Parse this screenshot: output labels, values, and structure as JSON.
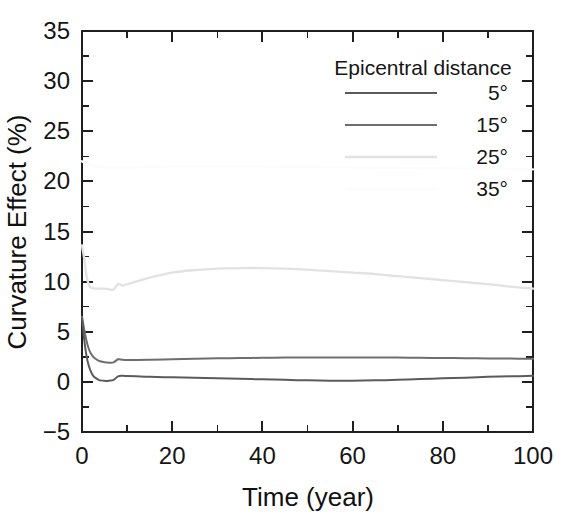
{
  "figure": {
    "background_color": "#ffffff",
    "axis_color": "#1f1f1f"
  },
  "axes": {
    "x_title": "Time (year)",
    "y_title": "Curvature Effect (%)",
    "x_ticks": [
      "0",
      "20",
      "40",
      "60",
      "80",
      "100"
    ],
    "y_ticks": [
      "-5",
      "0",
      "5",
      "10",
      "15",
      "20",
      "25",
      "30",
      "35"
    ]
  },
  "legend": {
    "title": "Epicentral distance",
    "entries": [
      {
        "label": "5°",
        "color": "#5b5b5b"
      },
      {
        "label": "15°",
        "color": "#6e6e6e"
      },
      {
        "label": "25°",
        "color": "#e2e2e2"
      },
      {
        "label": "35°",
        "color": "#fcfcfc"
      }
    ]
  },
  "chart_data": {
    "type": "line",
    "title": "",
    "xlabel": "Time (year)",
    "ylabel": "Curvature Effect (%)",
    "xlim": [
      0,
      100
    ],
    "ylim": [
      -5,
      35
    ],
    "xticks": [
      0,
      20,
      40,
      60,
      80,
      100
    ],
    "yticks": [
      -5,
      0,
      5,
      10,
      15,
      20,
      25,
      30,
      35
    ],
    "x_minor_step": 10,
    "y_minor_step": 2.5,
    "grid": false,
    "legend_position": "upper-right-inside",
    "legend_title": "Epicentral distance",
    "series": [
      {
        "name": "5°",
        "color": "#5b5b5b",
        "linewidth": 2.0,
        "x": [
          0.0,
          0.5,
          1.0,
          1.5,
          2.0,
          2.5,
          3.0,
          3.5,
          4.0,
          5.0,
          6.0,
          7.0,
          8.0,
          9.0,
          10.0,
          12.0,
          15.0,
          20.0,
          25.0,
          30.0,
          35.0,
          40.0,
          45.0,
          50.0,
          55.0,
          60.0,
          65.0,
          70.0,
          75.0,
          80.0,
          85.0,
          90.0,
          95.0,
          100.0
        ],
        "y": [
          6.4,
          4.2,
          2.6,
          1.6,
          1.0,
          0.6,
          0.4,
          0.25,
          0.15,
          0.1,
          0.12,
          0.2,
          0.55,
          0.6,
          0.58,
          0.55,
          0.5,
          0.45,
          0.4,
          0.35,
          0.3,
          0.25,
          0.2,
          0.15,
          0.12,
          0.12,
          0.15,
          0.2,
          0.28,
          0.35,
          0.42,
          0.5,
          0.55,
          0.6
        ]
      },
      {
        "name": "15°",
        "color": "#6e6e6e",
        "linewidth": 2.0,
        "x": [
          0.0,
          0.5,
          1.0,
          1.5,
          2.0,
          2.5,
          3.0,
          3.5,
          4.0,
          5.0,
          6.0,
          7.0,
          8.0,
          9.0,
          10.0,
          12.0,
          15.0,
          20.0,
          25.0,
          30.0,
          35.0,
          40.0,
          45.0,
          50.0,
          55.0,
          60.0,
          65.0,
          70.0,
          75.0,
          80.0,
          85.0,
          90.0,
          95.0,
          100.0
        ],
        "y": [
          6.5,
          5.2,
          4.1,
          3.3,
          2.8,
          2.5,
          2.3,
          2.15,
          2.05,
          1.95,
          1.92,
          1.95,
          2.25,
          2.2,
          2.18,
          2.18,
          2.2,
          2.25,
          2.3,
          2.35,
          2.38,
          2.4,
          2.42,
          2.43,
          2.44,
          2.44,
          2.43,
          2.42,
          2.4,
          2.38,
          2.36,
          2.34,
          2.32,
          2.3
        ]
      },
      {
        "name": "25°",
        "color": "#e2e2e2",
        "linewidth": 2.4,
        "x": [
          0.0,
          0.5,
          1.0,
          1.5,
          2.0,
          2.5,
          3.0,
          3.5,
          4.0,
          5.0,
          6.0,
          7.0,
          8.0,
          9.0,
          10.0,
          12.0,
          15.0,
          20.0,
          25.0,
          30.0,
          35.0,
          40.0,
          45.0,
          50.0,
          55.0,
          60.0,
          65.0,
          70.0,
          75.0,
          80.0,
          85.0,
          90.0,
          95.0,
          100.0
        ],
        "y": [
          13.6,
          12.3,
          10.6,
          9.7,
          9.4,
          9.35,
          9.3,
          9.3,
          9.3,
          9.3,
          9.25,
          9.2,
          9.75,
          9.6,
          9.75,
          10.0,
          10.4,
          10.9,
          11.15,
          11.3,
          11.35,
          11.35,
          11.3,
          11.2,
          11.05,
          10.9,
          10.75,
          10.55,
          10.35,
          10.15,
          9.95,
          9.75,
          9.5,
          9.3
        ]
      },
      {
        "name": "35°",
        "color": "#fcfcfc",
        "linewidth": 2.4,
        "x": [
          0.0,
          2.0,
          5.0,
          10.0,
          20.0,
          40.0,
          60.0,
          80.0,
          100.0
        ],
        "y": [
          22.0,
          21.6,
          21.4,
          21.4,
          21.5,
          21.5,
          21.4,
          21.3,
          21.2
        ]
      }
    ]
  }
}
